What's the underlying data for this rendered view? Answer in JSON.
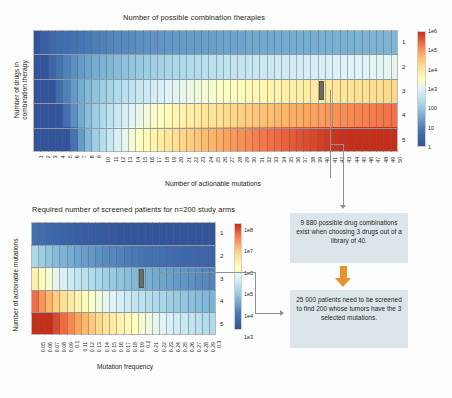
{
  "charts": {
    "top": {
      "title": "Number of possible combination therapies",
      "xlabel": "Number of actionable mutations",
      "ylabel_line1": "Number of drugs in",
      "ylabel_line2": "combination therapy",
      "colorbar_labels": [
        "1e6",
        "1e5",
        "1e4",
        "1e3",
        "100",
        "10",
        "1"
      ],
      "yticks": [
        "1",
        "2",
        "3",
        "4",
        "5"
      ],
      "xticks": [
        "1",
        "2",
        "3",
        "4",
        "5",
        "6",
        "7",
        "8",
        "9",
        "10",
        "11",
        "12",
        "13",
        "14",
        "15",
        "16",
        "17",
        "18",
        "19",
        "20",
        "21",
        "22",
        "23",
        "24",
        "25",
        "26",
        "27",
        "28",
        "29",
        "30",
        "31",
        "32",
        "33",
        "34",
        "35",
        "36",
        "37",
        "38",
        "39",
        "40",
        "41",
        "42",
        "43",
        "44",
        "45",
        "46",
        "47",
        "48",
        "49",
        "50"
      ]
    },
    "bottom": {
      "title": "Required number of screened patients for n=200 study arms",
      "xlabel": "Mutation frequency",
      "ylabel": "Number of actionable mutations",
      "colorbar_labels": [
        "1e8",
        "1e7",
        "1e6",
        "1e5",
        "1e4",
        "1e3"
      ],
      "yticks": [
        "1",
        "2",
        "3",
        "4",
        "5"
      ],
      "xticks": [
        "0.05",
        "0.06",
        "0.07",
        "0.08",
        "0.09",
        "0.1",
        "0.11",
        "0.12",
        "0.13",
        "0.14",
        "0.15",
        "0.16",
        "0.17",
        "0.18",
        "0.19",
        "0.2",
        "0.21",
        "0.22",
        "0.23",
        "0.24",
        "0.25",
        "0.26",
        "0.27",
        "0.28",
        "0.29",
        "0.3"
      ]
    }
  },
  "callouts": {
    "box1": "9 880 possible drug combinations exist when choosing 3 drugs out of a library of 40.",
    "box2": "25 000 patients need to be screened to find 200 whose tumors have the 3 selected mutations."
  },
  "colors": {
    "callout_bg": "#dce6ea",
    "arrow_orange": "#e8922a",
    "connector_gray": "#8c9298",
    "marker_gray": "#6d6d66",
    "cold": "#2a5f9e",
    "warm": "#d2411e"
  },
  "chart_data": [
    {
      "type": "heatmap",
      "title": "Number of possible combination therapies",
      "xlabel": "Number of actionable mutations",
      "ylabel": "Number of drugs in combination therapy",
      "x": [
        1,
        2,
        3,
        4,
        5,
        6,
        7,
        8,
        9,
        10,
        11,
        12,
        13,
        14,
        15,
        16,
        17,
        18,
        19,
        20,
        21,
        22,
        23,
        24,
        25,
        26,
        27,
        28,
        29,
        30,
        31,
        32,
        33,
        34,
        35,
        36,
        37,
        38,
        39,
        40,
        41,
        42,
        43,
        44,
        45,
        46,
        47,
        48,
        49,
        50
      ],
      "y": [
        1,
        2,
        3,
        4,
        5
      ],
      "value_note": "value = C(n_mutations, n_drugs), number of possible drug combinations",
      "colorscale": "RdYlBu reversed (log)",
      "colorbar_ticks": [
        "1",
        "10",
        "100",
        "1e3",
        "1e4",
        "1e5",
        "1e6"
      ],
      "zlim_log10": [
        0,
        6
      ],
      "highlight": {
        "x": 40,
        "y": 3,
        "value": 9880
      },
      "grid": true,
      "legend": "colorbar-right"
    },
    {
      "type": "heatmap",
      "title": "Required number of screened patients for n=200 study arms",
      "xlabel": "Mutation frequency",
      "ylabel": "Number of actionable mutations",
      "x": [
        0.05,
        0.06,
        0.07,
        0.08,
        0.09,
        0.1,
        0.11,
        0.12,
        0.13,
        0.14,
        0.15,
        0.16,
        0.17,
        0.18,
        0.19,
        0.2,
        0.21,
        0.22,
        0.23,
        0.24,
        0.25,
        0.26,
        0.27,
        0.28,
        0.29,
        0.3
      ],
      "y": [
        1,
        2,
        3,
        4,
        5
      ],
      "value_note": "value = 200 / (frequency ^ n_mutations), patients to screen",
      "colorscale": "RdYlBu reversed (log)",
      "colorbar_ticks": [
        "1e3",
        "1e4",
        "1e5",
        "1e6",
        "1e7",
        "1e8"
      ],
      "zlim_log10": [
        3,
        8
      ],
      "highlight": {
        "x": 0.2,
        "y": 3,
        "value": 25000
      },
      "grid": true,
      "legend": "colorbar-right"
    }
  ]
}
